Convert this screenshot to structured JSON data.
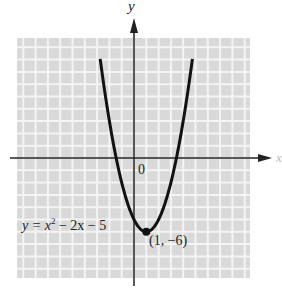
{
  "chart_data": {
    "type": "line",
    "title": "",
    "xlabel": "x",
    "ylabel": "y",
    "equation_label": "y = x² − 2x − 5",
    "function": "x^2 - 2x - 5",
    "origin_label": "0",
    "grid": true,
    "xlim": [
      -9.5,
      9.5
    ],
    "ylim": [
      -9.8,
      9.8
    ],
    "series": [
      {
        "name": "y = x^2 - 2x - 5",
        "x": [
          -2.7,
          -2,
          -1.45,
          -1,
          0,
          1,
          2,
          3,
          3.45,
          4,
          4.7
        ],
        "y": [
          7.7,
          3,
          0,
          -2,
          -5,
          -6,
          -5,
          -2,
          0,
          3,
          7.7
        ]
      }
    ],
    "annotations": [
      {
        "text": "(1, −6)",
        "x": 1,
        "y": -6,
        "type": "vertex-point"
      }
    ]
  },
  "labels": {
    "y_axis": "y",
    "x_axis": "x",
    "origin": "0",
    "equation_prefix": "y = x",
    "equation_sup": "2",
    "equation_suffix": " − 2x − 5",
    "vertex": "(1, −6)"
  },
  "colors": {
    "grid_background": "#d9d9d9",
    "grid_line": "#f4f4f4",
    "curve": "#111111",
    "axis": "#222222"
  }
}
